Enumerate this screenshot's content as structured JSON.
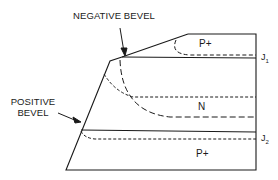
{
  "diagram": {
    "annotations": {
      "negative_bevel": "NEGATIVE BEVEL",
      "positive_bevel_line1": "POSITIVE",
      "positive_bevel_line2": "BEVEL"
    },
    "regions": {
      "top": "P+",
      "middle": "N",
      "bottom": "P+"
    },
    "junctions": {
      "j1_base": "J",
      "j1_sub": "1",
      "j2_base": "J",
      "j2_sub": "2"
    },
    "colors": {
      "line": "#1a1a1a",
      "background": "#ffffff"
    }
  }
}
